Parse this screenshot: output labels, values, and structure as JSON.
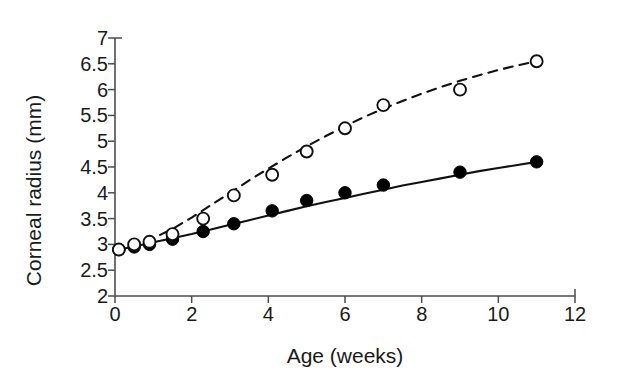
{
  "chart_data": {
    "type": "scatter",
    "title": "",
    "xlabel": "Age (weeks)",
    "ylabel": "Corneal radius (mm)",
    "xlim": [
      0,
      12
    ],
    "ylim": [
      2,
      7
    ],
    "xticks": [
      "0",
      "2",
      "4",
      "6",
      "8",
      "10",
      "12"
    ],
    "xtick_values": [
      0,
      2,
      4,
      6,
      8,
      10,
      12
    ],
    "yticks": [
      "2",
      "2.5",
      "3",
      "3.5",
      "4",
      "4.5",
      "5",
      "5.5",
      "6",
      "6.5",
      "7"
    ],
    "ytick_values": [
      2,
      2.5,
      3,
      3.5,
      4,
      4.5,
      5,
      5.5,
      6,
      6.5,
      7
    ],
    "grid": false,
    "legend": "none",
    "series": [
      {
        "name": "filled-circles-solid",
        "marker": "filled-circle",
        "line_style": "solid",
        "color": "#000000",
        "x": [
          0.1,
          0.5,
          0.9,
          1.5,
          2.3,
          3.1,
          4.1,
          5.0,
          6.0,
          7.0,
          9.0,
          11.0
        ],
        "values": [
          2.9,
          2.95,
          3.0,
          3.1,
          3.25,
          3.4,
          3.65,
          3.85,
          4.0,
          4.15,
          4.4,
          4.6
        ]
      },
      {
        "name": "open-circles-dashed",
        "marker": "open-circle",
        "line_style": "dashed",
        "color": "#000000",
        "x": [
          0.1,
          0.5,
          0.9,
          1.5,
          2.3,
          3.1,
          4.1,
          5.0,
          6.0,
          7.0,
          9.0,
          11.0
        ],
        "values": [
          2.9,
          3.0,
          3.05,
          3.2,
          3.5,
          3.95,
          4.35,
          4.8,
          5.25,
          5.7,
          6.0,
          6.55
        ]
      }
    ],
    "fit_curves": [
      {
        "name": "solid-fit-curve",
        "style": "solid",
        "x": [
          0,
          0.5,
          1,
          1.5,
          2,
          2.5,
          3,
          3.5,
          4,
          4.5,
          5,
          5.5,
          6,
          6.5,
          7,
          7.5,
          8,
          8.5,
          9,
          9.5,
          10,
          10.5,
          11
        ],
        "y": [
          2.88,
          2.96,
          3.04,
          3.12,
          3.2,
          3.29,
          3.38,
          3.47,
          3.56,
          3.65,
          3.74,
          3.82,
          3.9,
          3.98,
          4.06,
          4.14,
          4.21,
          4.28,
          4.35,
          4.42,
          4.48,
          4.54,
          4.6
        ]
      },
      {
        "name": "dashed-fit-curve",
        "style": "dashed",
        "x": [
          0,
          0.5,
          1,
          1.5,
          2,
          2.5,
          3,
          3.5,
          4,
          4.5,
          5,
          5.5,
          6,
          6.5,
          7,
          7.5,
          8,
          8.5,
          9,
          9.5,
          10,
          10.5,
          11
        ],
        "y": [
          2.87,
          2.98,
          3.12,
          3.3,
          3.52,
          3.76,
          4.0,
          4.24,
          4.47,
          4.69,
          4.9,
          5.1,
          5.29,
          5.47,
          5.63,
          5.78,
          5.92,
          6.05,
          6.17,
          6.28,
          6.38,
          6.47,
          6.55
        ]
      }
    ]
  },
  "axes": {
    "x_axis_px": {
      "x0": 115,
      "x12": 575,
      "y": 296
    },
    "y_axis_px": {
      "y2": 296,
      "y7": 38,
      "x": 115
    }
  }
}
